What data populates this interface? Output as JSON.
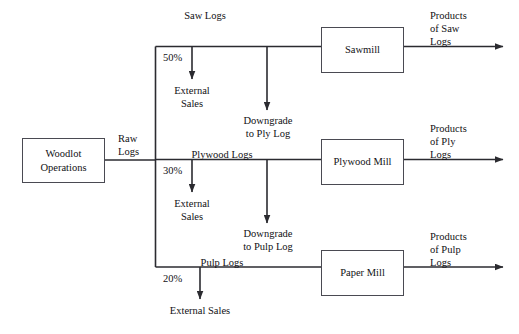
{
  "diagram": {
    "colors": {
      "line": "#2b2b30",
      "box_border": "#4a4a52",
      "text": "#111114",
      "background": "#ffffff"
    },
    "source": {
      "label": "Woodlot\nOperations",
      "output_label": "Raw\nLogs"
    },
    "branches": [
      {
        "id": "saw",
        "stream_label": "Saw Logs",
        "percent": "50%",
        "external_label": "External\nSales",
        "downgrade_label": "Downgrade\nto Ply Log",
        "mill_label": "Sawmill",
        "product_label": "Products\nof Saw\nLogs"
      },
      {
        "id": "plywood",
        "stream_label": "Plywood Logs",
        "percent": "30%",
        "external_label": "External\nSales",
        "downgrade_label": "Downgrade\nto Pulp Log",
        "mill_label": "Plywood\nMill",
        "product_label": "Products\nof Ply\nLogs"
      },
      {
        "id": "pulp",
        "stream_label": "Pulp Logs",
        "percent": "20%",
        "external_label": "External Sales",
        "downgrade_label": "",
        "mill_label": "Paper Mill",
        "product_label": "Products\nof Pulp\nLogs"
      }
    ]
  }
}
